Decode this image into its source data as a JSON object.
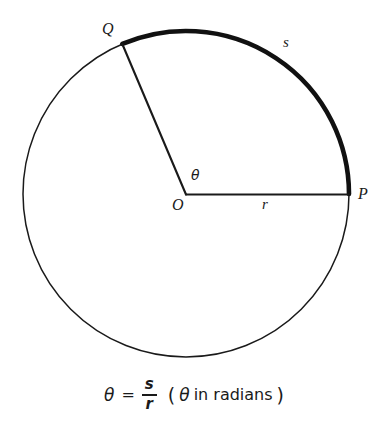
{
  "figure": {
    "type": "circle-sector-arc-length-diagram",
    "colors": {
      "ink": "#1a1a1a",
      "background": "#ffffff",
      "thin_stroke": "#1a1a1a",
      "thick_arc": "#111111"
    },
    "geometry": {
      "center": {
        "x": 186,
        "y": 194
      },
      "radius": 163,
      "point_P": {
        "x": 349,
        "y": 194,
        "angle_deg": 0
      },
      "point_Q": {
        "x": 122,
        "y": 43,
        "angle_deg": 113
      },
      "arc_sweep_deg": 113,
      "thin_stroke_width": 1.5,
      "radius_stroke_width": 2,
      "arc_stroke_width": 4.5
    },
    "labels": {
      "Q": "Q",
      "P": "P",
      "O": "O",
      "r": "r",
      "s": "s",
      "theta": "θ"
    }
  },
  "caption": {
    "theta": "θ",
    "equals": "=",
    "numerator": "s",
    "denominator": "r",
    "open_paren": "(",
    "theta_note": "θ",
    "note_text": "in radians",
    "close_paren": ")",
    "full_text": "θ = s/r (θ in radians)"
  }
}
